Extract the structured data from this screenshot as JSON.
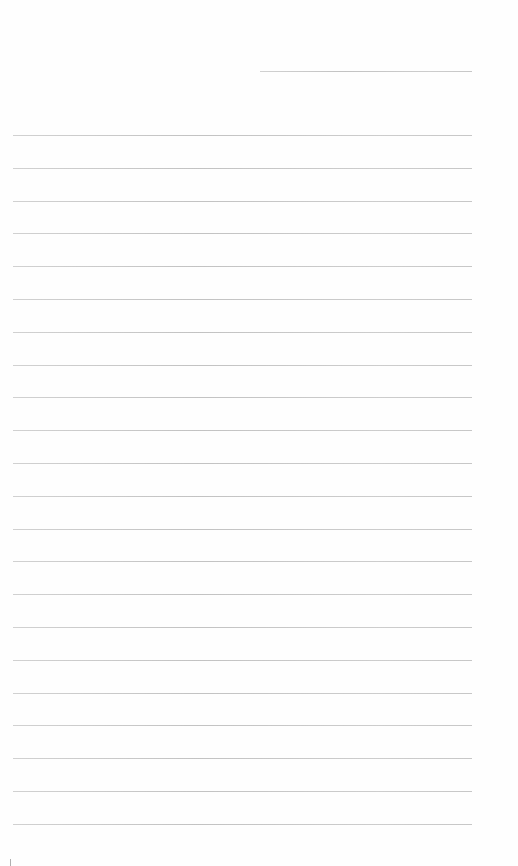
{
  "document": {
    "type": "lined-paper",
    "background_color": "#fefefe",
    "rule_color": "#bdbdbd",
    "header_rule": {
      "x_start": 260,
      "x_end": 472,
      "y": 71
    },
    "body_rules": {
      "x_start": 13,
      "x_end": 472,
      "y_start": 135,
      "spacing": 32.8,
      "count": 22
    },
    "text_lines": []
  }
}
